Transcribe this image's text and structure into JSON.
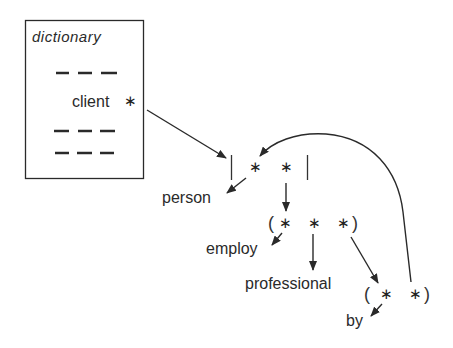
{
  "diagram": {
    "dictionary_box": {
      "title": "dictionary",
      "entry": "client",
      "pointer_symbol": "∗",
      "placeholder_lines": 3
    },
    "structure": {
      "bracket_open": "[",
      "bracket_close": "]",
      "slot_symbol": "∗",
      "paren_open": "(",
      "paren_close": ")"
    },
    "nodes": {
      "person": "person",
      "employ": "employ",
      "professional": "professional",
      "by": "by"
    },
    "colors": {
      "ink": "#2a2a2a",
      "background": "#ffffff"
    }
  }
}
